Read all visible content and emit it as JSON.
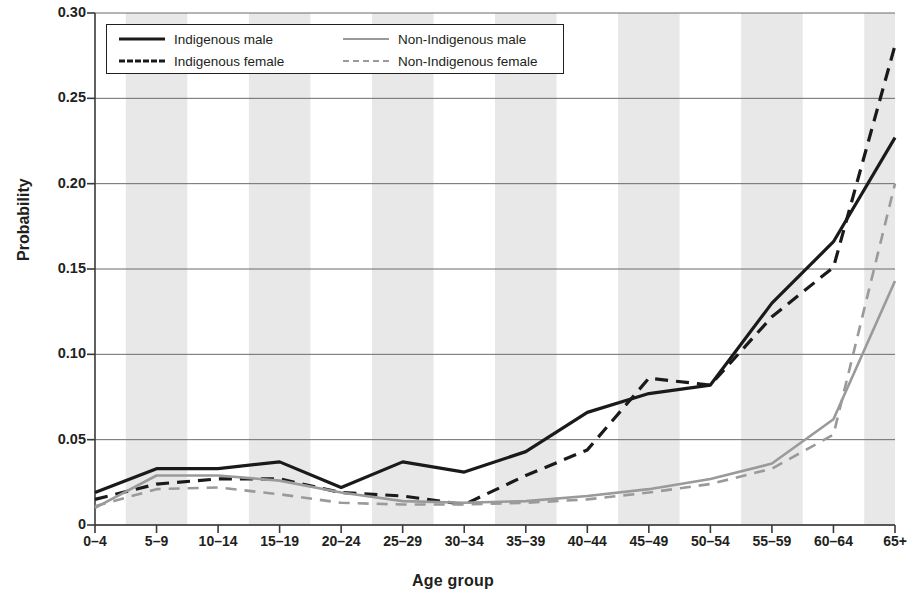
{
  "chart_data": {
    "type": "line",
    "title": "",
    "xlabel": "Age group",
    "ylabel": "Probability",
    "ylim": [
      0,
      0.3
    ],
    "yticks": [
      "0",
      "0.05",
      "0.10",
      "0.15",
      "0.20",
      "0.25",
      "0.30"
    ],
    "ytick_values": [
      0,
      0.05,
      0.1,
      0.15,
      0.2,
      0.25,
      0.3
    ],
    "grid": "horizontal gridlines at each y tick; alternating light-grey vertical bands behind odd-indexed categories",
    "legend_position": "top-left inside plot area, two columns, bordered box",
    "categories": [
      "0–4",
      "5–9",
      "10–14",
      "15–19",
      "20–24",
      "25–29",
      "30–34",
      "35–39",
      "40–44",
      "45–49",
      "50–54",
      "55–59",
      "60–64",
      "65+"
    ],
    "series": [
      {
        "name": "Indigenous male",
        "color": "#1a1a1a",
        "style": "solid",
        "values": [
          0.019,
          0.033,
          0.033,
          0.037,
          0.022,
          0.037,
          0.031,
          0.043,
          0.066,
          0.077,
          0.082,
          0.13,
          0.166,
          0.227
        ]
      },
      {
        "name": "Indigenous female",
        "color": "#1a1a1a",
        "style": "dashed",
        "values": [
          0.015,
          0.024,
          0.027,
          0.027,
          0.019,
          0.017,
          0.012,
          0.029,
          0.044,
          0.086,
          0.082,
          0.122,
          0.151,
          0.281
        ]
      },
      {
        "name": "Non-Indigenous male",
        "color": "#9a9a9a",
        "style": "solid",
        "values": [
          0.01,
          0.029,
          0.029,
          0.026,
          0.019,
          0.014,
          0.013,
          0.014,
          0.017,
          0.021,
          0.027,
          0.036,
          0.062,
          0.143
        ]
      },
      {
        "name": "Non-Indigenous female",
        "color": "#9a9a9a",
        "style": "dashed",
        "values": [
          0.011,
          0.021,
          0.022,
          0.018,
          0.013,
          0.012,
          0.012,
          0.013,
          0.015,
          0.019,
          0.024,
          0.033,
          0.053,
          0.2
        ]
      }
    ]
  },
  "legend": {
    "entries": [
      {
        "label": "Indigenous male",
        "swatch": "solid-black-line-icon"
      },
      {
        "label": "Indigenous female",
        "swatch": "dashed-black-line-icon"
      },
      {
        "label": "Non-Indigenous male",
        "swatch": "solid-gray-line-icon"
      },
      {
        "label": "Non-Indigenous female",
        "swatch": "dashed-gray-line-icon"
      }
    ]
  },
  "axes": {
    "y_title": "Probability",
    "x_title": "Age group"
  },
  "colors": {
    "indigenous": "#1a1a1a",
    "non_indigenous": "#9a9a9a",
    "band": "#e8e8e8",
    "gridline": "#6b6b6b",
    "axis": "#3a3a3a",
    "text": "#231f20"
  }
}
